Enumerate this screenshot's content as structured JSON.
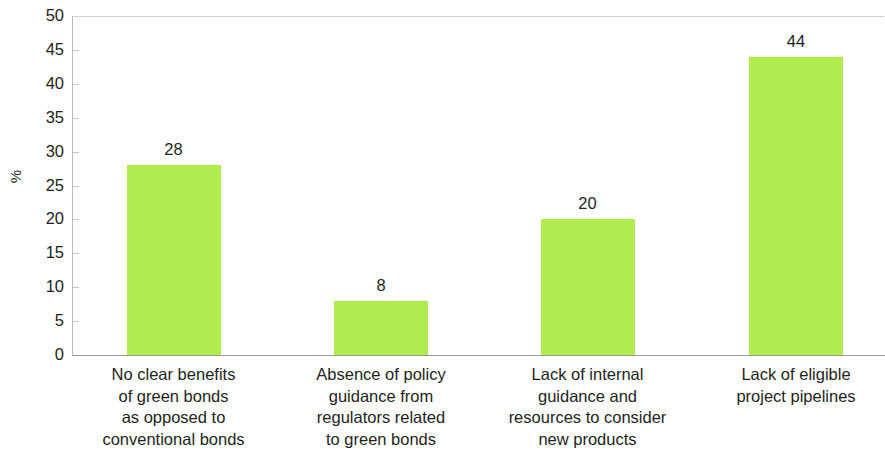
{
  "chart_data": {
    "type": "bar",
    "title": "",
    "subtitle": "",
    "xlabel": "",
    "ylabel": "%",
    "ylim": [
      0,
      50
    ],
    "ytick_step": 5,
    "grid": false,
    "legend": "none",
    "bar_color": "#b1ec4f",
    "text_color": "#231f20",
    "categories": [
      "No clear benefits\nof green bonds\nas opposed to\nconventional bonds",
      "Absence of policy\nguidance from\nregulators related\nto green bonds",
      "Lack of internal\nguidance and\nresources to consider\nnew products",
      "Lack of eligible\nproject pipelines"
    ],
    "values": [
      28,
      8,
      20,
      44
    ],
    "value_labels": [
      "28",
      "8",
      "20",
      "44"
    ],
    "ytick_labels": [
      "50",
      "45",
      "40",
      "35",
      "30",
      "25",
      "20",
      "15",
      "10",
      "5",
      "0"
    ],
    "ytick_values": [
      50,
      45,
      40,
      35,
      30,
      25,
      20,
      15,
      10,
      5,
      0
    ]
  }
}
